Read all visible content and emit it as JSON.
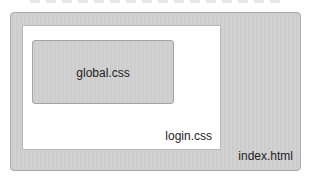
{
  "diagram": {
    "type": "nested-boxes",
    "boxes": [
      {
        "id": "outer",
        "label": "index.html",
        "fill": "#cfcfcf"
      },
      {
        "id": "middle",
        "label": "login.css",
        "fill": "#ffffff"
      },
      {
        "id": "inner",
        "label": "global.css",
        "fill": "#cfcfcf"
      }
    ]
  },
  "colors": {
    "gray_fill": "#cfcfcf",
    "white_fill": "#ffffff",
    "border": "#a9a9a9",
    "text": "#1e1e1e"
  }
}
